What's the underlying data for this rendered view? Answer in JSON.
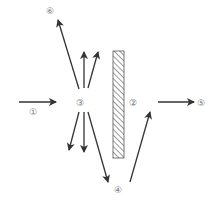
{
  "diagram": {
    "labels": {
      "l1": "①",
      "l2": "②",
      "l3": "③",
      "l4": "④",
      "l5": "⑤",
      "l6": "⑥"
    },
    "colors": {
      "arrow": "#333333",
      "label": "#777777",
      "wall_hatch": "#555555"
    }
  }
}
